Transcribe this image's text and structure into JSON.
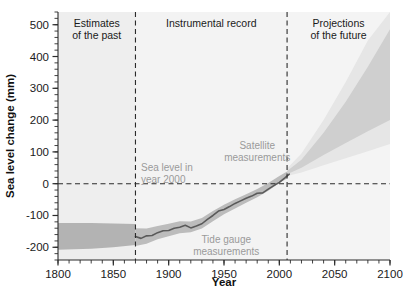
{
  "figure": {
    "background": "#ffffff",
    "plot_background": "#f2f2f2"
  },
  "chart_data": {
    "type": "line",
    "title": "",
    "xlabel": "Year",
    "ylabel": "Sea level change (mm)",
    "xlim": [
      1800,
      2100
    ],
    "ylim": [
      -240,
      540
    ],
    "xticks": [
      1800,
      1850,
      1900,
      1950,
      2000,
      2050,
      2100
    ],
    "xtick_labels": [
      "1800",
      "1850",
      "1900",
      "1950",
      "2000",
      "2050",
      "2100"
    ],
    "yticks": [
      -200,
      -100,
      0,
      100,
      200,
      300,
      400,
      500
    ],
    "ytick_labels": [
      "-200",
      "-100",
      "0",
      "100",
      "200",
      "300",
      "400",
      "500"
    ],
    "minor_tick_step_x": 10,
    "minor_tick_step_y": 20,
    "grid": false,
    "legend_position": "inline-annotations",
    "reference_lines": [
      {
        "name": "sea-level-year-2000",
        "orientation": "horizontal",
        "value": 0,
        "style": "dashed",
        "color": "#2b2b2b"
      },
      {
        "name": "era-divider-1870",
        "orientation": "vertical",
        "value": 1870,
        "style": "dashed",
        "color": "#2b2b2b"
      },
      {
        "name": "era-divider-2007",
        "orientation": "vertical",
        "value": 2007,
        "style": "dashed",
        "color": "#2b2b2b"
      }
    ],
    "eras": [
      {
        "id": "past",
        "label_line1": "Estimates",
        "label_line2": "of the past",
        "x_start": 1800,
        "x_end": 1870
      },
      {
        "id": "instrumental",
        "label_line1": "Instrumental record",
        "label_line2": "",
        "x_start": 1870,
        "x_end": 2007
      },
      {
        "id": "future",
        "label_line1": "Projections",
        "label_line2": "of the future",
        "x_start": 2007,
        "x_end": 2100
      }
    ],
    "annotations": [
      {
        "id": "sea-level-2000",
        "line1": "Sea level in",
        "line2": "year 2000",
        "x": 1875,
        "y": 40,
        "color": "#9a9a9a"
      },
      {
        "id": "satellite",
        "line1": "Satellite",
        "line2": "measurements",
        "x": 1980,
        "y": 110,
        "color": "#9a9a9a"
      },
      {
        "id": "tide-gauge",
        "line1": "Tide gauge",
        "line2": "measurements",
        "x": 1952,
        "y": -185,
        "color": "#4a4a4a"
      }
    ],
    "series": [
      {
        "name": "Proxy estimates uncertainty band (past)",
        "type": "band",
        "color": "#b3b3b3",
        "x": [
          1800,
          1830,
          1850,
          1870
        ],
        "upper": [
          -124,
          -124,
          -125,
          -127
        ],
        "lower": [
          -208,
          -205,
          -200,
          -193
        ]
      },
      {
        "name": "Tide gauge uncertainty band",
        "type": "band",
        "color": "#bcbcbc",
        "x": [
          1870,
          1880,
          1890,
          1900,
          1910,
          1920,
          1930,
          1940,
          1950,
          1960,
          1970,
          1980,
          1990,
          2000,
          2007
        ],
        "upper": [
          -140,
          -141,
          -133,
          -126,
          -118,
          -119,
          -108,
          -86,
          -66,
          -49,
          -33,
          -17,
          2,
          24,
          38
        ],
        "lower": [
          -196,
          -189,
          -175,
          -165,
          -156,
          -153,
          -141,
          -118,
          -96,
          -78,
          -60,
          -43,
          -22,
          2,
          16
        ]
      },
      {
        "name": "Tide gauge measurements",
        "type": "line",
        "color": "#5a5a5a",
        "x": [
          1870,
          1875,
          1880,
          1885,
          1890,
          1895,
          1900,
          1905,
          1910,
          1915,
          1920,
          1925,
          1930,
          1935,
          1940,
          1945,
          1950,
          1955,
          1960,
          1965,
          1970,
          1975,
          1980,
          1985,
          1990,
          1995,
          2000,
          2005,
          2009
        ],
        "values": [
          -166,
          -172,
          -164,
          -163,
          -154,
          -148,
          -147,
          -140,
          -137,
          -131,
          -139,
          -133,
          -126,
          -112,
          -100,
          -86,
          -81,
          -72,
          -62,
          -54,
          -46,
          -39,
          -30,
          -29,
          -17,
          -6,
          4,
          18,
          30
        ]
      },
      {
        "name": "Projection range (future)",
        "type": "band",
        "color": "#cfcfcf",
        "x": [
          2007,
          2020,
          2040,
          2060,
          2080,
          2100
        ],
        "upper": [
          40,
          75,
          160,
          258,
          368,
          486
        ],
        "lower": [
          30,
          50,
          90,
          128,
          165,
          200
        ]
      },
      {
        "name": "Projection outer range (future)",
        "type": "band",
        "color": "#e6e6e6",
        "x": [
          2007,
          2020,
          2040,
          2060,
          2080,
          2100
        ],
        "upper": [
          48,
          95,
          200,
          320,
          450,
          540
        ],
        "lower": [
          24,
          35,
          58,
          80,
          102,
          125
        ]
      }
    ]
  }
}
